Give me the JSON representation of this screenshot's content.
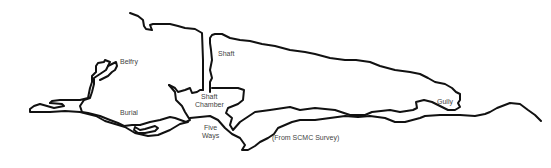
{
  "map": {
    "type": "cave survey plan",
    "stroke_color": "#111111",
    "label_color": "#444444",
    "labels": {
      "belfry": "Belfry",
      "shaft": "Shaft",
      "shaft_chamber_1": "Shaft",
      "shaft_chamber_2": "Chamber",
      "burial": "Burial",
      "five_ways_1": "Five",
      "five_ways_2": "Ways",
      "gully": "Gully",
      "source": "(From SCMC Survey)"
    }
  }
}
